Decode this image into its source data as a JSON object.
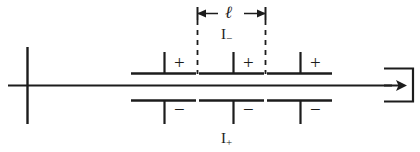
{
  "figure": {
    "background_color": "#ffffff",
    "ink_color": "#1c1c1c",
    "width": 420,
    "height": 152
  },
  "labels": {
    "length": "ℓ",
    "negative_current": "I",
    "negative_current_sub": "−",
    "positive_current": "I",
    "positive_current_sub": "+",
    "plus_1": "+",
    "plus_2": "+",
    "plus_3": "+",
    "minus_1": "−",
    "minus_2": "−",
    "minus_3": "−"
  },
  "geometry": {
    "axis_y": 85,
    "axis_x_start": 8,
    "axis_x_end": 392,
    "upper_plate_y": 73,
    "lower_plate_y": 100,
    "left_marker_x": 27,
    "left_marker_top": 47,
    "left_marker_bottom": 124,
    "dash_left_x": 197,
    "dash_right_x": 266,
    "dimension_arrow_y": 13,
    "upper_segments": [
      {
        "x1": 131,
        "x2": 196,
        "stem_x": 164,
        "stem_top": 52,
        "sign_x": 173
      },
      {
        "x1": 199,
        "x2": 264,
        "stem_x": 233,
        "stem_top": 52,
        "sign_x": 242
      },
      {
        "x1": 267,
        "x2": 332,
        "stem_x": 300,
        "stem_top": 52,
        "sign_x": 309
      }
    ],
    "lower_segments": [
      {
        "x1": 131,
        "x2": 196,
        "stem_x": 164,
        "stem_bottom": 124,
        "sign_x": 173
      },
      {
        "x1": 199,
        "x2": 264,
        "stem_x": 233,
        "stem_bottom": 124,
        "sign_x": 242
      },
      {
        "x1": 267,
        "x2": 332,
        "stem_x": 300,
        "stem_bottom": 124,
        "sign_x": 309
      }
    ],
    "output_box": {
      "x": 384,
      "y": 68,
      "width": 30,
      "height": 34
    }
  }
}
